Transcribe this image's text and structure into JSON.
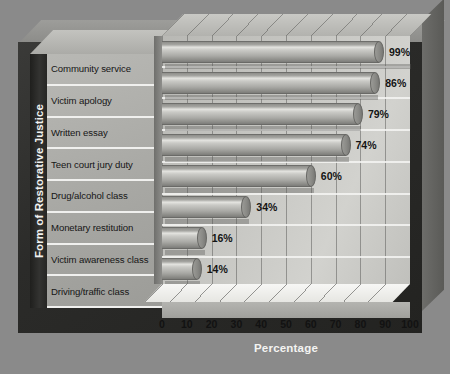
{
  "chart_data": {
    "type": "bar",
    "orientation": "horizontal",
    "title": "",
    "xlabel": "Percentage",
    "ylabel": "Form of Restorative Justice",
    "categories": [
      "Community service",
      "Victim apology",
      "Written essay",
      "Teen court jury duty",
      "Drug/alcohol class",
      "Monetary restitution",
      "Victim awareness class",
      "Driving/traffic class"
    ],
    "values": [
      99,
      86,
      79,
      74,
      60,
      34,
      16,
      14
    ],
    "value_labels": [
      "99%",
      "86%",
      "79%",
      "74%",
      "60%",
      "34%",
      "16%",
      "14%"
    ],
    "xlim": [
      0,
      100
    ],
    "xticks": [
      0,
      10,
      20,
      30,
      40,
      50,
      60,
      70,
      80,
      90,
      100
    ],
    "xtick_labels": [
      "0",
      "10",
      "20",
      "30",
      "40",
      "50",
      "60",
      "70",
      "80",
      "90",
      "100"
    ],
    "grid": "vertical",
    "legend": "none",
    "style": "3d-cylinder-bars"
  },
  "colors": {
    "background": "#8a8a8a",
    "frame_front": "#2b2b29",
    "frame_top": "#9d9d9a",
    "plot_area": "#c6c6c2",
    "label_column": "#b0b0ac",
    "axis_title_band": "#262624",
    "axis_title_text": "#f2f2f0",
    "bar_body": "#a9a9a5",
    "bar_highlight": "#e4e4e0",
    "value_text": "#141414",
    "tick_text": "#121212",
    "floor_top": "#f2f2ef"
  }
}
